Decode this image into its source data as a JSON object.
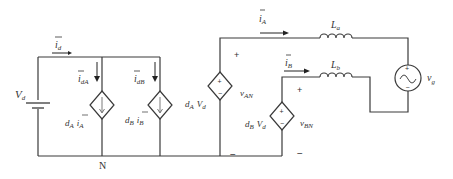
{
  "diagram": {
    "type": "circuit-schematic",
    "nodes": {
      "neutral": "N"
    },
    "dc_source": {
      "symbol": "V",
      "sub": "d"
    },
    "currents": {
      "i_d": {
        "symbol": "i",
        "sub": "d",
        "overbar": true
      },
      "i_dA": {
        "symbol": "i",
        "sub": "dA",
        "overbar": true
      },
      "i_dB": {
        "symbol": "i",
        "sub": "dB",
        "overbar": true
      },
      "i_A": {
        "symbol": "i",
        "sub": "A",
        "overbar": true
      },
      "i_B": {
        "symbol": "i",
        "sub": "B",
        "overbar": true
      }
    },
    "dependent_current_sources": [
      {
        "coef": "d",
        "coef_sub": "A",
        "var": "i",
        "var_sub": "A"
      },
      {
        "coef": "d",
        "coef_sub": "B",
        "var": "i",
        "var_sub": "B"
      }
    ],
    "dependent_voltage_sources": [
      {
        "coef": "d",
        "coef_sub": "A",
        "var": "V",
        "var_sub": "d",
        "voltage": "v",
        "voltage_sub": "AN",
        "plus": "+",
        "minus": "−"
      },
      {
        "coef": "d",
        "coef_sub": "B",
        "var": "V",
        "var_sub": "d",
        "voltage": "v",
        "voltage_sub": "BN",
        "plus": "+",
        "minus": "−"
      }
    ],
    "inductors": [
      {
        "symbol": "L",
        "sub": "a"
      },
      {
        "symbol": "L",
        "sub": "b"
      }
    ],
    "ac_source": {
      "symbol": "v",
      "sub": "g",
      "plus": "+",
      "minus": "−"
    }
  }
}
